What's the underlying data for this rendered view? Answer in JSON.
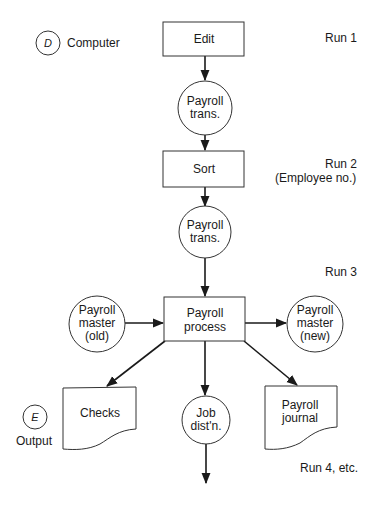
{
  "diagram": {
    "type": "system flowchart",
    "legend": [
      {
        "symbol": "D",
        "label": "Computer"
      },
      {
        "symbol": "E",
        "label": "Output"
      }
    ],
    "runs": [
      {
        "label": "Run 1"
      },
      {
        "label": "Run 2",
        "sub": "(Employee no.)"
      },
      {
        "label": "Run 3"
      },
      {
        "label": "Run 4, etc."
      }
    ],
    "nodes": {
      "edit": {
        "shape": "process",
        "lines": [
          "Edit"
        ]
      },
      "trans1": {
        "shape": "file",
        "lines": [
          "Payroll",
          "trans."
        ]
      },
      "sort": {
        "shape": "process",
        "lines": [
          "Sort"
        ]
      },
      "trans2": {
        "shape": "file",
        "lines": [
          "Payroll",
          "trans."
        ]
      },
      "process": {
        "shape": "process",
        "lines": [
          "Payroll",
          "process"
        ]
      },
      "master_old": {
        "shape": "file",
        "lines": [
          "Payroll",
          "master",
          "(old)"
        ]
      },
      "master_new": {
        "shape": "file",
        "lines": [
          "Payroll",
          "master",
          "(new)"
        ]
      },
      "checks": {
        "shape": "document",
        "lines": [
          "Checks"
        ]
      },
      "job": {
        "shape": "file",
        "lines": [
          "Job",
          "dist'n."
        ]
      },
      "journal": {
        "shape": "document",
        "lines": [
          "Payroll",
          "journal"
        ]
      }
    },
    "edges": [
      [
        "edit",
        "trans1"
      ],
      [
        "trans1",
        "sort"
      ],
      [
        "sort",
        "trans2"
      ],
      [
        "trans2",
        "process"
      ],
      [
        "master_old",
        "process"
      ],
      [
        "process",
        "master_new"
      ],
      [
        "process",
        "checks"
      ],
      [
        "process",
        "job"
      ],
      [
        "process",
        "journal"
      ],
      [
        "job",
        "next-run"
      ]
    ],
    "colors": {
      "stroke": "#1a1a1a",
      "background": "#ffffff"
    }
  }
}
